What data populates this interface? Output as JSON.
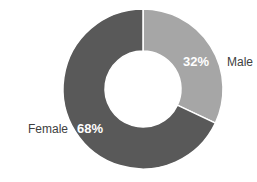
{
  "chart_data": {
    "type": "pie",
    "subtype": "donut",
    "title": "",
    "categories": [
      "Male",
      "Female"
    ],
    "values": [
      32,
      68
    ],
    "labels": [
      "32%",
      "68%"
    ],
    "colors": [
      "#a6a6a6",
      "#595959"
    ],
    "legend": "none (labels placed outside slices)",
    "start_angle_deg": 0,
    "direction": "clockwise"
  },
  "labels": {
    "male_name": "Male",
    "male_pct": "32%",
    "female_name": "Female",
    "female_pct": "68%"
  }
}
